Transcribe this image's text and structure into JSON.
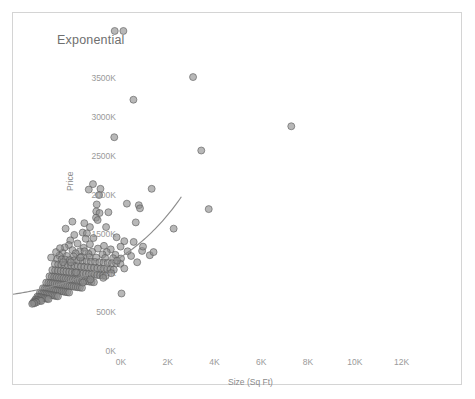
{
  "chart_data": {
    "type": "scatter",
    "title": "Exponential",
    "xlabel": "Size (Sq Ft)",
    "ylabel": "Price",
    "xlim": [
      0,
      13000
    ],
    "ylim": [
      0,
      3750000
    ],
    "xticks": [
      "0K",
      "2K",
      "4K",
      "6K",
      "8K",
      "10K",
      "12K"
    ],
    "xtick_values": [
      0,
      2000,
      4000,
      6000,
      8000,
      10000,
      12000
    ],
    "yticks": [
      "0K",
      "500K",
      "1000K",
      "1500K",
      "2000K",
      "2500K",
      "3000K",
      "3500K"
    ],
    "ytick_values": [
      0,
      500000,
      1000000,
      1500000,
      2000000,
      2500000,
      3000000,
      3500000
    ],
    "grid": false,
    "legend": null,
    "series": [
      {
        "name": "Price vs Size",
        "mark": "circle",
        "color": "#8c8c8c",
        "points": [
          [
            4350,
            3520000
          ],
          [
            4720,
            3520000
          ],
          [
            7700,
            2930000
          ],
          [
            5150,
            2640000
          ],
          [
            11900,
            2300000
          ],
          [
            4330,
            2160000
          ],
          [
            8050,
            1990000
          ],
          [
            5930,
            1500000
          ],
          [
            3740,
            1500000
          ],
          [
            3680,
            1420000
          ],
          [
            3580,
            1300000
          ],
          [
            5380,
            1290000
          ],
          [
            5430,
            1250000
          ],
          [
            8370,
            1240000
          ],
          [
            3560,
            1210000
          ],
          [
            3700,
            1190000
          ],
          [
            3550,
            1130000
          ],
          [
            3620,
            1100000
          ],
          [
            5250,
            1070000
          ],
          [
            3050,
            1060000
          ],
          [
            6870,
            990000
          ],
          [
            2980,
            940000
          ],
          [
            3160,
            930000
          ],
          [
            2620,
            910000
          ],
          [
            4430,
            880000
          ],
          [
            3440,
            870000
          ],
          [
            3110,
            860000
          ],
          [
            2450,
            840000
          ],
          [
            4760,
            830000
          ],
          [
            5160,
            820000
          ],
          [
            2760,
            800000
          ],
          [
            3290,
            790000
          ],
          [
            2390,
            780000
          ],
          [
            3890,
            770000
          ],
          [
            4600,
            760000
          ],
          [
            2210,
            750000
          ],
          [
            3020,
            745000
          ],
          [
            3630,
            735000
          ],
          [
            4180,
            725000
          ],
          [
            2540,
            715000
          ],
          [
            5520,
            705000
          ],
          [
            2860,
            700000
          ],
          [
            3380,
            695000
          ],
          [
            4010,
            690000
          ],
          [
            2120,
            680000
          ],
          [
            2680,
            675000
          ],
          [
            3230,
            668000
          ],
          [
            3830,
            660000
          ],
          [
            4380,
            655000
          ],
          [
            5850,
            650000
          ],
          [
            1980,
            645000
          ],
          [
            2300,
            640000
          ],
          [
            2590,
            635000
          ],
          [
            2930,
            630000
          ],
          [
            3270,
            625000
          ],
          [
            3560,
            620000
          ],
          [
            3940,
            615000
          ],
          [
            4280,
            612000
          ],
          [
            4620,
            608000
          ],
          [
            1880,
            600000
          ],
          [
            2080,
            596000
          ],
          [
            2250,
            592000
          ],
          [
            2430,
            588000
          ],
          [
            2610,
            584000
          ],
          [
            2790,
            580000
          ],
          [
            2970,
            576000
          ],
          [
            3150,
            572000
          ],
          [
            3330,
            568000
          ],
          [
            3510,
            564000
          ],
          [
            3690,
            560000
          ],
          [
            3870,
            556000
          ],
          [
            4050,
            552000
          ],
          [
            4230,
            548000
          ],
          [
            4410,
            544000
          ],
          [
            4590,
            540000
          ],
          [
            1790,
            536000
          ],
          [
            1930,
            532000
          ],
          [
            2070,
            528000
          ],
          [
            2210,
            524000
          ],
          [
            2350,
            520000
          ],
          [
            2490,
            516000
          ],
          [
            2630,
            512000
          ],
          [
            2770,
            508000
          ],
          [
            2910,
            504000
          ],
          [
            3050,
            500000
          ],
          [
            3190,
            496000
          ],
          [
            3330,
            492000
          ],
          [
            3470,
            488000
          ],
          [
            3610,
            484000
          ],
          [
            3750,
            480000
          ],
          [
            3890,
            476000
          ],
          [
            4030,
            472000
          ],
          [
            4170,
            468000
          ],
          [
            4310,
            464000
          ],
          [
            1680,
            460000
          ],
          [
            1800,
            456000
          ],
          [
            1920,
            452000
          ],
          [
            2040,
            448000
          ],
          [
            2160,
            444000
          ],
          [
            2280,
            440000
          ],
          [
            2400,
            436000
          ],
          [
            2520,
            432000
          ],
          [
            2640,
            428000
          ],
          [
            2760,
            424000
          ],
          [
            2880,
            420000
          ],
          [
            3000,
            416000
          ],
          [
            3120,
            412000
          ],
          [
            3240,
            408000
          ],
          [
            3360,
            404000
          ],
          [
            3480,
            400000
          ],
          [
            3600,
            396000
          ],
          [
            3720,
            392000
          ],
          [
            3840,
            388000
          ],
          [
            3960,
            384000
          ],
          [
            1560,
            380000
          ],
          [
            1660,
            376000
          ],
          [
            1760,
            372000
          ],
          [
            1860,
            368000
          ],
          [
            1960,
            364000
          ],
          [
            2060,
            360000
          ],
          [
            2160,
            356000
          ],
          [
            2260,
            352000
          ],
          [
            2360,
            348000
          ],
          [
            2460,
            344000
          ],
          [
            2560,
            340000
          ],
          [
            2660,
            336000
          ],
          [
            2760,
            332000
          ],
          [
            2860,
            328000
          ],
          [
            2960,
            324000
          ],
          [
            3060,
            320000
          ],
          [
            3160,
            316000
          ],
          [
            3260,
            312000
          ],
          [
            3360,
            308000
          ],
          [
            3460,
            304000
          ],
          [
            1420,
            300000
          ],
          [
            1510,
            296000
          ],
          [
            1600,
            292000
          ],
          [
            1690,
            288000
          ],
          [
            1780,
            284000
          ],
          [
            1870,
            280000
          ],
          [
            1960,
            276000
          ],
          [
            2050,
            272000
          ],
          [
            2140,
            268000
          ],
          [
            2230,
            264000
          ],
          [
            2320,
            260000
          ],
          [
            2410,
            256000
          ],
          [
            2500,
            252000
          ],
          [
            2590,
            248000
          ],
          [
            2680,
            244000
          ],
          [
            2770,
            240000
          ],
          [
            2860,
            236000
          ],
          [
            2950,
            232000
          ],
          [
            1280,
            228000
          ],
          [
            1360,
            224000
          ],
          [
            1440,
            220000
          ],
          [
            1520,
            216000
          ],
          [
            1600,
            212000
          ],
          [
            1680,
            208000
          ],
          [
            1760,
            204000
          ],
          [
            1840,
            200000
          ],
          [
            1920,
            196000
          ],
          [
            2000,
            192000
          ],
          [
            2080,
            188000
          ],
          [
            2160,
            184000
          ],
          [
            2240,
            180000
          ],
          [
            2320,
            176000
          ],
          [
            2400,
            172000
          ],
          [
            1150,
            168000
          ],
          [
            1220,
            164000
          ],
          [
            1290,
            160000
          ],
          [
            1360,
            156000
          ],
          [
            1430,
            152000
          ],
          [
            1500,
            148000
          ],
          [
            1570,
            144000
          ],
          [
            1640,
            140000
          ],
          [
            1710,
            136000
          ],
          [
            1780,
            132000
          ],
          [
            1850,
            128000
          ],
          [
            1920,
            124000
          ],
          [
            1040,
            120000
          ],
          [
            1100,
            116000
          ],
          [
            1160,
            112000
          ],
          [
            1220,
            108000
          ],
          [
            1280,
            104000
          ],
          [
            1340,
            100000
          ],
          [
            1400,
            96000
          ],
          [
            1460,
            92000
          ],
          [
            1520,
            88000
          ],
          [
            960,
            84000
          ],
          [
            1010,
            80000
          ],
          [
            1060,
            76000
          ],
          [
            1110,
            72000
          ],
          [
            1160,
            68000
          ],
          [
            1210,
            64000
          ],
          [
            900,
            58000
          ],
          [
            950,
            52000
          ],
          [
            1000,
            46000
          ],
          [
            860,
            40000
          ],
          [
            910,
            34000
          ],
          [
            820,
            28000
          ],
          [
            2880,
            620000
          ],
          [
            3060,
            700000
          ],
          [
            2470,
            560000
          ],
          [
            4900,
            700000
          ],
          [
            5050,
            640000
          ],
          [
            4450,
            580000
          ],
          [
            3980,
            1010000
          ],
          [
            3290,
            1010000
          ],
          [
            2700,
            430000
          ],
          [
            2140,
            560000
          ],
          [
            5560,
            760000
          ],
          [
            6010,
            690000
          ],
          [
            3420,
            1560000
          ],
          [
            3240,
            1490000
          ],
          [
            4080,
            1200000
          ],
          [
            4870,
            1310000
          ],
          [
            2250,
            990000
          ],
          [
            2540,
            1080000
          ],
          [
            4200,
            420000
          ],
          [
            4760,
            480000
          ],
          [
            5310,
            560000
          ],
          [
            3860,
            360000
          ],
          [
            3310,
            340000
          ],
          [
            2990,
            300000
          ],
          [
            1630,
            620000
          ],
          [
            1840,
            690000
          ],
          [
            2010,
            740000
          ],
          [
            4640,
            160000
          ]
        ]
      }
    ],
    "trendline": {
      "type": "exponential",
      "color": "#8d8d8d",
      "a": 150000,
      "b": 0.00031,
      "x_start": 0,
      "x_end": 7200
    }
  }
}
